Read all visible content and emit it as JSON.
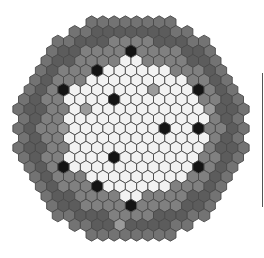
{
  "figure": {
    "type": "hexagonal-core-map",
    "grid": {
      "center_x": 131,
      "center_y": 128.5,
      "col_pitch": 11.25,
      "row_pitch": 9.65,
      "rows": 12,
      "outer_radius": 117
    },
    "colors": {
      "white": "#f2f2f2",
      "light_gray": "#9a9a9a",
      "mid_gray": "#808080",
      "dark_gray": "#5c5c5c",
      "outer_gray": "#737373",
      "black": "#141414"
    },
    "zones": {
      "white_radius": 72,
      "mid_radius": 92,
      "dark_radius": 106
    },
    "black_cells": [
      [
        133,
        54
      ],
      [
        100,
        73
      ],
      [
        198,
        93
      ],
      [
        68,
        93
      ],
      [
        117,
        103
      ],
      [
        165,
        132
      ],
      [
        198,
        132
      ],
      [
        117,
        161
      ],
      [
        68,
        170
      ],
      [
        197,
        170
      ],
      [
        100,
        189
      ],
      [
        133,
        208
      ]
    ],
    "light_gray_cells": [
      [
        148,
        73
      ],
      [
        84,
        112
      ],
      [
        156,
        93
      ],
      [
        203,
        151
      ],
      [
        68,
        131
      ],
      [
        148,
        190
      ],
      [
        181,
        208
      ],
      [
        117,
        229
      ],
      [
        213,
        112
      ]
    ]
  }
}
